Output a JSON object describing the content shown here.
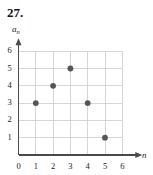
{
  "problem": {
    "number": "27."
  },
  "chart_data": {
    "type": "scatter",
    "title": "",
    "xlabel": "n",
    "ylabel": "a_n",
    "ylabel_base": "a",
    "ylabel_sub": "n",
    "x": [
      1,
      2,
      3,
      4,
      5
    ],
    "values": [
      3,
      4,
      5,
      3,
      1
    ],
    "points": [
      {
        "n": 1,
        "a": 3
      },
      {
        "n": 2,
        "a": 4
      },
      {
        "n": 3,
        "a": 5
      },
      {
        "n": 4,
        "a": 3
      },
      {
        "n": 5,
        "a": 1
      }
    ],
    "xlim": [
      0,
      6
    ],
    "ylim": [
      0,
      6
    ],
    "xticks": [
      0,
      1,
      2,
      3,
      4,
      5,
      6
    ],
    "yticks": [
      1,
      2,
      3,
      4,
      5,
      6
    ],
    "xtick_labels": [
      "0",
      "1",
      "2",
      "3",
      "4",
      "5",
      "6"
    ],
    "ytick_labels": [
      "1",
      "2",
      "3",
      "4",
      "5",
      "6"
    ],
    "grid": true,
    "legend": "none",
    "marker": "filled-circle",
    "colors": {
      "marker": "#555555",
      "axis": "#4a4a4a",
      "grid": "#cccccc",
      "text": "#1c1c1c",
      "background": "#ffffff"
    }
  }
}
